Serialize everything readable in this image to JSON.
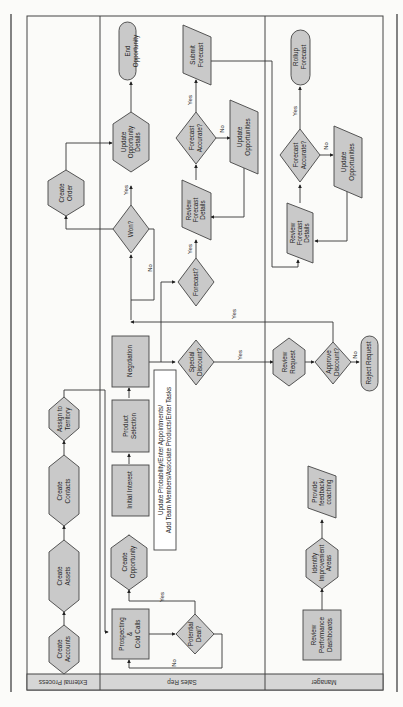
{
  "diagram": {
    "lanes": [
      {
        "id": "external",
        "label": "External Process"
      },
      {
        "id": "sales",
        "label": "Sales Rep"
      },
      {
        "id": "manager",
        "label": "Manager"
      }
    ],
    "nodes": {
      "create_accounts": {
        "l1": "Create",
        "l2": "Accounts"
      },
      "create_assets": {
        "l1": "Create",
        "l2": "Assets"
      },
      "create_contacts": {
        "l1": "Create",
        "l2": "Contacts"
      },
      "assign_territory": {
        "l1": "Assign to",
        "l2": "Territory"
      },
      "create_order": {
        "l1": "Create",
        "l2": "Order"
      },
      "prospecting": {
        "l1": "Prospecting",
        "l2": "&",
        "l3": "Cold Calls"
      },
      "potential_deal": {
        "l1": "Potential",
        "l2": "Deal?"
      },
      "create_opportunity": {
        "l1": "Create",
        "l2": "Opportunity"
      },
      "initial_interest": {
        "l1": "Initial Interest"
      },
      "product_selection": {
        "l1": "Product",
        "l2": "Selection"
      },
      "negotiation": {
        "l1": "Negotiation"
      },
      "note": {
        "l1": "Update Probability/Enter Appointments/",
        "l2": "Add Team Members/Associate Products/Enter Tasks"
      },
      "special_discount": {
        "l1": "Special",
        "l2": "Discount?"
      },
      "forecast_q": {
        "l1": "Forecast?"
      },
      "won": {
        "l1": "Won?"
      },
      "update_opp_details": {
        "l1": "Update",
        "l2": "Opportunity",
        "l3": "Details"
      },
      "end_opportunity": {
        "l1": "End",
        "l2": "Opportunity"
      },
      "review_forecast_sr": {
        "l1": "Review",
        "l2": "Forecast",
        "l3": "Details"
      },
      "forecast_accurate_sr": {
        "l1": "Forecast",
        "l2": "Accurate?"
      },
      "update_opps_sr": {
        "l1": "Update",
        "l2": "Opportunities"
      },
      "submit_forecast": {
        "l1": "Submit",
        "l2": "Forecast"
      },
      "review_dashboards": {
        "l1": "Review",
        "l2": "Performance",
        "l3": "Dashboards"
      },
      "identify_areas": {
        "l1": "Identify",
        "l2": "Improvement",
        "l3": "Areas"
      },
      "provide_feedback": {
        "l1": "Provide",
        "l2": "feedback/",
        "l3": "coaching"
      },
      "review_request": {
        "l1": "Review",
        "l2": "Request"
      },
      "approve_discount": {
        "l1": "Approve",
        "l2": "Discount?"
      },
      "reject_request": {
        "l1": "Reject Request"
      },
      "review_forecast_mg": {
        "l1": "Review",
        "l2": "Forecast",
        "l3": "Details"
      },
      "forecast_accurate_mg": {
        "l1": "Forecast",
        "l2": "Accurate?"
      },
      "update_opps_mg": {
        "l1": "Update",
        "l2": "Opportunities"
      },
      "rollup_forecast": {
        "l1": "Rollup",
        "l2": "Forecast"
      }
    },
    "edge_labels": {
      "yes": "Yes",
      "no": "No"
    }
  }
}
